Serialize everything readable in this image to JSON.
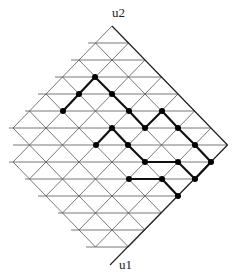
{
  "labels": {
    "top_axis": "u2",
    "bottom_axis": "u1"
  },
  "colors": {
    "grid": "#555555",
    "boundary": "#222222",
    "path": "#111111",
    "dot": "#000000"
  },
  "lattice": {
    "top_apex": [
      112,
      26
    ],
    "row_height": 17,
    "half_step": 16.5,
    "rows": 14,
    "row_left_ends": [
      null,
      88,
      71,
      55,
      38,
      25,
      9,
      13,
      9,
      25,
      38,
      58,
      71,
      86
    ],
    "boundary_end": [
      110,
      265
    ]
  },
  "path_edges": [
    [
      [
        63,
        111
      ],
      [
        79,
        94
      ]
    ],
    [
      [
        79,
        94
      ],
      [
        95,
        77
      ]
    ],
    [
      [
        95,
        77
      ],
      [
        112,
        94
      ]
    ],
    [
      [
        112,
        94
      ],
      [
        129,
        111
      ]
    ],
    [
      [
        129,
        111
      ],
      [
        145,
        128
      ]
    ],
    [
      [
        145,
        128
      ],
      [
        162,
        111
      ]
    ],
    [
      [
        162,
        111
      ],
      [
        178,
        128
      ]
    ],
    [
      [
        178,
        128
      ],
      [
        195,
        145
      ]
    ],
    [
      [
        195,
        145
      ],
      [
        211,
        162
      ]
    ],
    [
      [
        211,
        162
      ],
      [
        195,
        179
      ]
    ],
    [
      [
        96,
        145
      ],
      [
        112,
        128
      ]
    ],
    [
      [
        112,
        128
      ],
      [
        128,
        145
      ]
    ],
    [
      [
        128,
        145
      ],
      [
        145,
        162
      ]
    ],
    [
      [
        145,
        162
      ],
      [
        178,
        162
      ]
    ],
    [
      [
        178,
        162
      ],
      [
        195,
        179
      ]
    ],
    [
      [
        129,
        179
      ],
      [
        162,
        179
      ]
    ],
    [
      [
        162,
        179
      ],
      [
        178,
        196
      ]
    ]
  ],
  "dots": [
    [
      95,
      77
    ],
    [
      79,
      94
    ],
    [
      112,
      94
    ],
    [
      63,
      111
    ],
    [
      129,
      111
    ],
    [
      162,
      111
    ],
    [
      112,
      128
    ],
    [
      145,
      128
    ],
    [
      178,
      128
    ],
    [
      96,
      145
    ],
    [
      128,
      145
    ],
    [
      195,
      145
    ],
    [
      145,
      162
    ],
    [
      178,
      162
    ],
    [
      211,
      162
    ],
    [
      129,
      179
    ],
    [
      162,
      179
    ],
    [
      195,
      179
    ],
    [
      178,
      196
    ]
  ]
}
